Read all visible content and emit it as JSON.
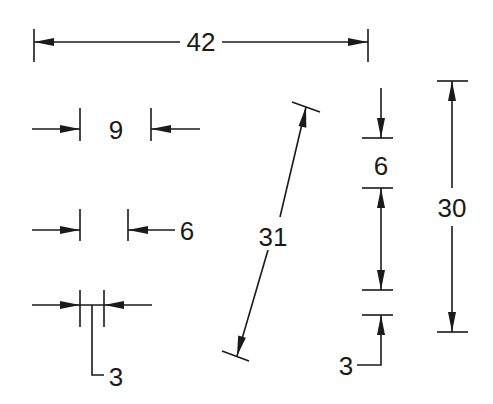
{
  "diagram": {
    "type": "dimensioning-conventions",
    "colors": {
      "line": "#1a1a1a",
      "background": "#ffffff"
    },
    "dimensions": [
      {
        "id": "overall-horizontal",
        "label": "42",
        "orientation": "horizontal",
        "style": "arrows-inside-text-centered"
      },
      {
        "id": "small-horizontal-9",
        "label": "9",
        "orientation": "horizontal",
        "style": "arrows-outside-text-between"
      },
      {
        "id": "small-horizontal-6",
        "label": "6",
        "orientation": "horizontal",
        "style": "arrows-outside-text-outside"
      },
      {
        "id": "small-horizontal-3",
        "label": "3",
        "orientation": "horizontal",
        "style": "arrows-outside-leader-text"
      },
      {
        "id": "aligned-31",
        "label": "31",
        "orientation": "aligned",
        "style": "arrows-inside-text-centered"
      },
      {
        "id": "vertical-6",
        "label": "6",
        "orientation": "vertical",
        "style": "arrows-outside-text-between"
      },
      {
        "id": "vertical-3",
        "label": "3",
        "orientation": "vertical",
        "style": "arrow-outside-leader-text"
      },
      {
        "id": "overall-vertical",
        "label": "30",
        "orientation": "vertical",
        "style": "arrows-inside-text-centered"
      }
    ]
  }
}
